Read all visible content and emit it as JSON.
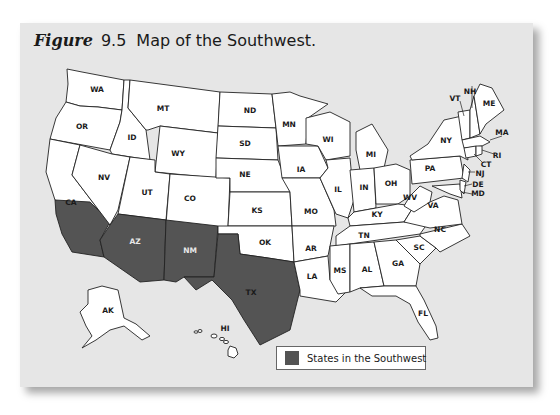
{
  "figure": {
    "label": "Figure",
    "number": "9.5",
    "title": "Map of the Southwest."
  },
  "legend": {
    "swatch_color": "#545454",
    "label": "States in the Southwest"
  },
  "colors": {
    "panel_background": "#e6e6e6",
    "state_fill": "#ffffff",
    "southwest_fill": "#545454",
    "border": "#222222"
  },
  "highlighted_states": [
    "CA",
    "AZ",
    "NM",
    "TX"
  ],
  "states": {
    "WA": "WA",
    "OR": "OR",
    "CA": "CA",
    "NV": "NV",
    "ID": "ID",
    "MT": "MT",
    "WY": "WY",
    "UT": "UT",
    "CO": "CO",
    "AZ": "AZ",
    "NM": "NM",
    "ND": "ND",
    "SD": "SD",
    "NE": "NE",
    "KS": "KS",
    "OK": "OK",
    "TX": "TX",
    "MN": "MN",
    "IA": "IA",
    "MO": "MO",
    "AR": "AR",
    "LA": "LA",
    "WI": "WI",
    "IL": "IL",
    "MI": "MI",
    "IN": "IN",
    "OH": "OH",
    "KY": "KY",
    "TN": "TN",
    "MS": "MS",
    "AL": "AL",
    "GA": "GA",
    "FL": "FL",
    "SC": "SC",
    "NC": "NC",
    "VA": "VA",
    "WV": "WV",
    "PA": "PA",
    "NY": "NY",
    "VT": "VT",
    "NH": "NH",
    "ME": "ME",
    "MA": "MA",
    "RI": "RI",
    "CT": "CT",
    "NJ": "NJ",
    "DE": "DE",
    "MD": "MD",
    "AK": "AK",
    "HI": "HI"
  }
}
